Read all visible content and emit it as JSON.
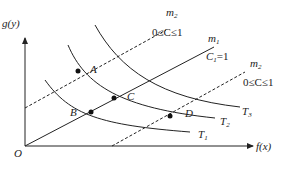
{
  "axes": {
    "y_label": "g(y)",
    "x_label": "f(x)",
    "origin_label": "O"
  },
  "lines": {
    "m1": {
      "name": "m",
      "sub": "1",
      "constraint": "C",
      "constraint_sub": "1",
      "constraint_value": "=1"
    },
    "m2_upper": {
      "name": "m",
      "sub": "2",
      "constraint": "0≤C≤1"
    },
    "m2_lower": {
      "name": "m",
      "sub": "2",
      "constraint": "0≤C≤1"
    }
  },
  "curves": [
    {
      "name": "T",
      "sub": "1"
    },
    {
      "name": "T",
      "sub": "2"
    },
    {
      "name": "T",
      "sub": "3"
    }
  ],
  "points": [
    {
      "label": "A"
    },
    {
      "label": "B"
    },
    {
      "label": "C"
    },
    {
      "label": "D"
    }
  ],
  "colors": {
    "stroke": "#222222",
    "background": "#ffffff"
  }
}
